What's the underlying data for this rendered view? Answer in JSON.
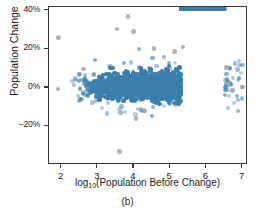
{
  "figure": {
    "caption": "(b)",
    "axis_color": "#3a3a3a",
    "point_color": "#3c7fad",
    "outlier_color": "#9aa7b4"
  },
  "chart_data": {
    "type": "scatter",
    "title": "",
    "xlabel_prefix": "log",
    "xlabel_sub": "10",
    "xlabel_suffix": "(Population Before Change)",
    "xlabel": "log10(Population Before Change)",
    "ylabel": "Population Change",
    "xlim": [
      1.65,
      7.15
    ],
    "ylim": [
      -0.4,
      0.42
    ],
    "grid": false,
    "legend": null,
    "xticks": [
      2,
      3,
      4,
      5,
      6,
      7
    ],
    "xtick_labels": [
      "2",
      "3",
      "4",
      "5",
      "6",
      "7"
    ],
    "yticks": [
      0.4,
      0.2,
      0.0,
      -0.2
    ],
    "ytick_labels": [
      "40%",
      "20%",
      "0%",
      "−20%"
    ],
    "marker_size_px": 2.2,
    "n_points_drawn": 2600,
    "cloud": {
      "x_range": [
        2.55,
        6.65
      ],
      "x_mode": 4.9,
      "y_center_at_x": {
        "2.6": 0.005,
        "3.5": 0.005,
        "4.5": 0.008,
        "5.3": 0.015,
        "6.0": 0.02,
        "6.5": 0.02
      },
      "y_spread_at_x": {
        "2.6": 0.022,
        "3.5": 0.03,
        "4.5": 0.03,
        "5.3": 0.034,
        "6.0": 0.03,
        "6.5": 0.022
      },
      "y_range_bulk": [
        -0.09,
        0.12
      ]
    },
    "outliers": [
      {
        "x": 1.92,
        "y": 0.262
      },
      {
        "x": 1.9,
        "y": -0.005
      },
      {
        "x": 3.83,
        "y": 0.372
      },
      {
        "x": 3.53,
        "y": 0.305
      },
      {
        "x": 3.98,
        "y": 0.292
      },
      {
        "x": 4.55,
        "y": 0.205
      },
      {
        "x": 5.35,
        "y": 0.213
      },
      {
        "x": 5.12,
        "y": 0.19
      },
      {
        "x": 2.6,
        "y": 0.098
      },
      {
        "x": 3.6,
        "y": -0.33
      },
      {
        "x": 4.05,
        "y": -0.158
      },
      {
        "x": 3.62,
        "y": -0.128
      },
      {
        "x": 4.28,
        "y": -0.118
      },
      {
        "x": 6.72,
        "y": -0.012
      },
      {
        "x": 7.0,
        "y": 0.005
      },
      {
        "x": 6.55,
        "y": 0.105
      }
    ]
  }
}
